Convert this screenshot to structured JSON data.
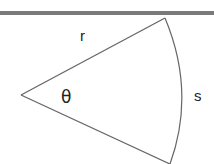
{
  "diagram": {
    "type": "circular-sector",
    "labels": {
      "radius": "r",
      "angle": "θ",
      "arc": "s"
    },
    "colors": {
      "band": "#7a7a7a",
      "stroke": "#666666",
      "text": "#222222",
      "background": "#ffffff"
    }
  }
}
